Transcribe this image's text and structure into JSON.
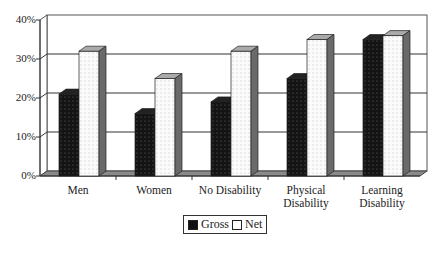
{
  "chart_data": {
    "type": "bar",
    "style": "3d-clustered-column",
    "title": "",
    "xlabel": "",
    "ylabel": "",
    "categories": [
      "Men",
      "Women",
      "No Disability",
      "Physical Disability",
      "Learning Disability"
    ],
    "category_lines": [
      [
        "Men"
      ],
      [
        "Women"
      ],
      [
        "No Disability"
      ],
      [
        "Physical",
        "Disability"
      ],
      [
        "Learning",
        "Disability"
      ]
    ],
    "series": [
      {
        "name": "Gross",
        "values": [
          21,
          16,
          19,
          25,
          35
        ],
        "pattern": "dark-dotted",
        "color": "#111111"
      },
      {
        "name": "Net",
        "values": [
          32,
          25,
          32,
          35,
          36
        ],
        "pattern": "light-dotted",
        "color": "#ffffff"
      }
    ],
    "ylim": [
      0,
      40
    ],
    "yticks": [
      "0%",
      "10%",
      "20%",
      "30%",
      "40%"
    ],
    "grid": true,
    "legend_position": "bottom"
  },
  "legend": {
    "gross": "Gross",
    "net": "Net"
  }
}
